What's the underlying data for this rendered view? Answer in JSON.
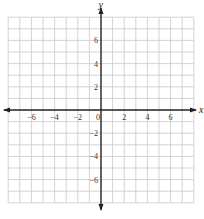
{
  "chart_data": {
    "type": "coordinate-grid",
    "title": "",
    "xlabel": "x",
    "ylabel": "y",
    "xlim": [
      -8,
      8
    ],
    "ylim": [
      -8,
      8
    ],
    "grid": true,
    "grid_step": 1,
    "x_ticks": [
      -6,
      -4,
      -2,
      0,
      2,
      4,
      6
    ],
    "y_ticks": [
      -6,
      -4,
      -2,
      2,
      4,
      6
    ],
    "x_tick_labels": [
      "−6",
      "−4",
      "−2",
      "0",
      "2",
      "4",
      "6"
    ],
    "y_tick_labels": [
      "−6",
      "−4",
      "−2",
      "2",
      "4",
      "6"
    ],
    "arrows": {
      "x_axis": "both",
      "y_axis": "both"
    },
    "series": []
  },
  "axes": {
    "x_name": "x",
    "y_name": "y"
  },
  "colors": {
    "grid": "#c8c8c8",
    "axis": "#222222",
    "label": "#333333"
  }
}
